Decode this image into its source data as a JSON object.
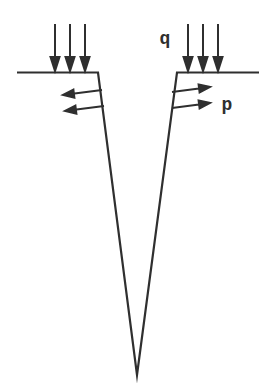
{
  "figure": {
    "paper_color": "#ffffff",
    "ink_color": "#2f2f2f",
    "labels": {
      "surface_load": "q",
      "face_load": "p"
    },
    "outline_points": "17,72.5 98,72.5 137,375 177,72.5 259,72.5",
    "arrows": {
      "q_left": [
        "M55,24 L55,59 M50.5,57 L55,71 L59.5,57 Z",
        "M70,24 L70,59 M65.5,57 L70,71 L74.5,57 Z",
        "M85,24 L85,59 M80.5,57 L85,71 L89.5,57 Z"
      ],
      "q_right": [
        "M188,24 L188,59 M183.5,57 L188,71 L192.5,57 Z",
        "M203,24 L203,59 M198.5,57 L203,71 L207.5,57 Z",
        "M218,24 L218,59 M213.5,57 L218,71 L222.5,57 Z"
      ],
      "p_left": [
        "M102,90 L74.5,93.4 M73.4,89.6 L63,95 L74.4,97.6 Z",
        "M104,106 L76.5,109.4 M75.4,105.6 L65,111 L76.4,113.6 Z"
      ],
      "p_right": [
        "M172,92 L199,88.5 M198.6,84.5 L210,87 L199.6,92.4 Z",
        "M172,108 L199,104.5 M198.6,100.5 L210,103 L199.6,108.4 Z"
      ]
    }
  }
}
